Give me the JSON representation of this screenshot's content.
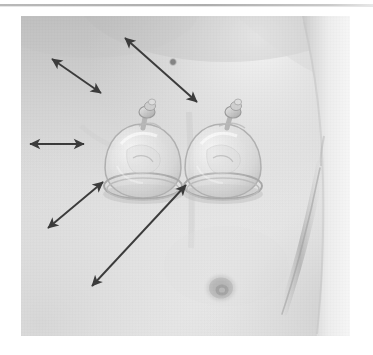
{
  "figure": {
    "kind": "clinical-photograph",
    "caption": "",
    "background_color": "#ffffff",
    "skin_color": "#e2e2e2",
    "annotation_color": "#3a3a3a",
    "rule": {
      "name": "top-horizontal-rule",
      "color": "#b0b0b0"
    },
    "photo": {
      "left": 21,
      "top": 16,
      "width": 329,
      "height": 320,
      "border_color": "#cfcfcf"
    },
    "annotations": [
      {
        "id": "arrow-1",
        "label": "",
        "type": "double-headed-arrow",
        "x1": 31,
        "y1": 43,
        "x2": 80,
        "y2": 77
      },
      {
        "id": "arrow-2",
        "label": "",
        "type": "double-headed-arrow",
        "x1": 104,
        "y1": 22,
        "x2": 176,
        "y2": 86
      },
      {
        "id": "arrow-3",
        "label": "",
        "type": "double-headed-arrow",
        "x1": 9,
        "y1": 128,
        "x2": 63,
        "y2": 128
      },
      {
        "id": "arrow-4",
        "label": "",
        "type": "double-headed-arrow",
        "x1": 27,
        "y1": 212,
        "x2": 82,
        "y2": 166
      },
      {
        "id": "arrow-5",
        "label": "",
        "type": "double-headed-arrow",
        "x1": 71,
        "y1": 270,
        "x2": 165,
        "y2": 169
      }
    ],
    "features": [
      {
        "id": "cup-left",
        "name": "suction-cup-left",
        "cx": 122,
        "cy": 150
      },
      {
        "id": "cup-right",
        "name": "suction-cup-right",
        "cx": 201,
        "cy": 150
      },
      {
        "id": "mole",
        "name": "skin-mole",
        "cx": 152,
        "cy": 46
      },
      {
        "id": "nipple",
        "name": "right-nipple",
        "cx": 200,
        "cy": 272
      }
    ]
  }
}
